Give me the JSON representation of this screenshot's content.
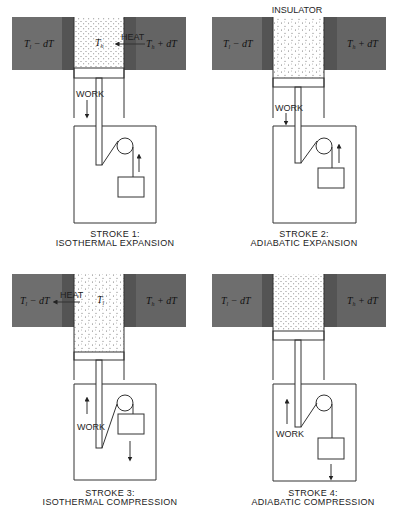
{
  "figure": {
    "insulator_label": "INSULATOR",
    "colors": {
      "cold_reservoir": "#6e6e6e",
      "hot_reservoir": "#646464",
      "contact_strip": "#545454",
      "gas": "#ffffff",
      "outline": "#333333"
    },
    "panels": [
      {
        "id": "stroke-1",
        "caption_line1": "STROKE 1:",
        "caption_line2": "ISOTHERMAL EXPANSION",
        "cold_label": "T",
        "cold_sub": "l",
        "cold_suffix": " − dT",
        "hot_label": "T",
        "hot_sub": "h",
        "hot_suffix": " + dT",
        "gas_label": "T",
        "gas_sub": "h",
        "heat_label": "HEAT",
        "heat_direction": "into-gas-from-hot",
        "work_label": "WORK",
        "work_direction": "down",
        "weight_direction": "up"
      },
      {
        "id": "stroke-2",
        "caption_line1": "STROKE 2:",
        "caption_line2": "ADIABATIC EXPANSION",
        "cold_label": "T",
        "cold_sub": "l",
        "cold_suffix": " − dT",
        "hot_label": "T",
        "hot_sub": "h",
        "hot_suffix": " + dT",
        "work_label": "WORK",
        "work_direction": "down",
        "weight_direction": "up"
      },
      {
        "id": "stroke-3",
        "caption_line1": "STROKE 3:",
        "caption_line2": "ISOTHERMAL COMPRESSION",
        "cold_label": "T",
        "cold_sub": "l",
        "cold_suffix": " − dT",
        "hot_label": "T",
        "hot_sub": "h",
        "hot_suffix": " + dT",
        "gas_label": "T",
        "gas_sub": "l",
        "heat_label": "HEAT",
        "heat_direction": "out-of-gas-to-cold",
        "work_label": "WORK",
        "work_direction": "up",
        "weight_direction": "down"
      },
      {
        "id": "stroke-4",
        "caption_line1": "STROKE 4:",
        "caption_line2": "ADIABATIC COMPRESSION",
        "cold_label": "T",
        "cold_sub": "l",
        "cold_suffix": " − dT",
        "hot_label": "T",
        "hot_sub": "h",
        "hot_suffix": " + dT",
        "work_label": "WORK",
        "work_direction": "up",
        "weight_direction": "down"
      }
    ]
  }
}
